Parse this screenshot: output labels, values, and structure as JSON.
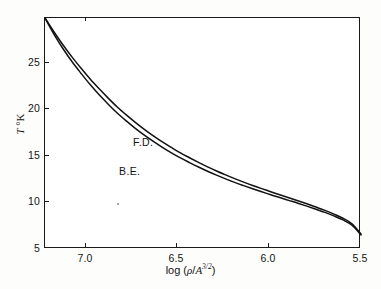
{
  "figure": {
    "background_color": "#fdfdfc",
    "plot_background_color": "#ffffff",
    "axis_color": "#1a1a1a"
  },
  "axes": {
    "y_label_symbol": "T",
    "y_label_unit": "°K",
    "x_label_prefix": "log (",
    "x_label_rho": "ρ",
    "x_label_slash": "/",
    "x_label_a": "A",
    "x_label_exponent": "3/2",
    "x_label_suffix": ")"
  },
  "chart_data": {
    "type": "line",
    "title": "",
    "subtitle": "",
    "xlabel": "log (ρ/A^3/2)",
    "ylabel": "T °K",
    "xlim": [
      7.25,
      5.5
    ],
    "ylim": [
      5,
      29.8
    ],
    "x_ticks": [
      7.0,
      6.5,
      6.0,
      5.5
    ],
    "x_tick_labels": [
      "7.0",
      "6.5",
      "6.0",
      "5.5"
    ],
    "y_ticks": [
      25,
      20,
      15,
      10,
      5
    ],
    "y_tick_labels": [
      "25",
      "20",
      "15",
      "10",
      "5"
    ],
    "x_axis_direction": "decreasing",
    "grid": false,
    "legend": "inline-annotations",
    "annotations": [
      {
        "text": "F.D.",
        "x": 6.73,
        "y": 16.2
      },
      {
        "text": "B.E.",
        "x": 6.81,
        "y": 13.1
      }
    ],
    "series": [
      {
        "name": "F.D.",
        "full_name": "Fermi-Dirac",
        "color": "#121212",
        "x": [
          7.25,
          7.2,
          7.15,
          7.1,
          7.05,
          7.0,
          6.95,
          6.9,
          6.85,
          6.8,
          6.75,
          6.7,
          6.65,
          6.6,
          6.55,
          6.5,
          6.45,
          6.4,
          6.35,
          6.3,
          6.25,
          6.2,
          6.15,
          6.1,
          6.05,
          6.0,
          5.95,
          5.9,
          5.85,
          5.8,
          5.75,
          5.7,
          5.65,
          5.6,
          5.55,
          5.5
        ],
        "y": [
          29.8,
          28.3,
          26.9,
          25.6,
          24.4,
          23.25,
          22.2,
          21.2,
          20.25,
          19.4,
          18.6,
          17.85,
          17.15,
          16.5,
          15.9,
          15.32,
          14.8,
          14.3,
          13.82,
          13.38,
          12.96,
          12.56,
          12.18,
          11.82,
          11.48,
          11.15,
          10.82,
          10.5,
          10.18,
          9.85,
          9.5,
          9.15,
          8.75,
          8.3,
          7.7,
          6.6
        ]
      },
      {
        "name": "B.E.",
        "full_name": "Bose-Einstein",
        "color": "#121212",
        "x": [
          7.25,
          7.2,
          7.15,
          7.1,
          7.05,
          7.0,
          6.95,
          6.9,
          6.85,
          6.8,
          6.75,
          6.7,
          6.65,
          6.6,
          6.55,
          6.5,
          6.45,
          6.4,
          6.35,
          6.3,
          6.25,
          6.2,
          6.15,
          6.1,
          6.05,
          6.0,
          5.95,
          5.9,
          5.85,
          5.8,
          5.75,
          5.7,
          5.65,
          5.6,
          5.55,
          5.5
        ],
        "y": [
          29.8,
          28.05,
          26.5,
          25.1,
          23.85,
          22.65,
          21.55,
          20.55,
          19.6,
          18.75,
          17.95,
          17.22,
          16.55,
          15.92,
          15.33,
          14.78,
          14.28,
          13.8,
          13.35,
          12.93,
          12.53,
          12.15,
          11.8,
          11.46,
          11.14,
          10.83,
          10.52,
          10.22,
          9.92,
          9.6,
          9.27,
          8.93,
          8.55,
          8.12,
          7.55,
          6.5
        ]
      }
    ]
  }
}
